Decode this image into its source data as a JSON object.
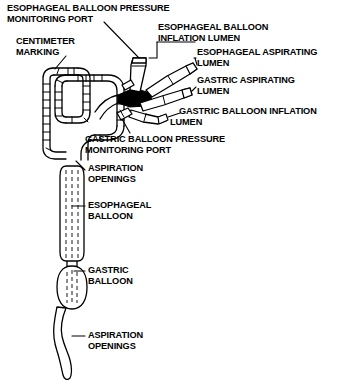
{
  "diagram": {
    "type": "medical-device-line-drawing",
    "colors": {
      "background": "#ffffff",
      "stroke": "#000000",
      "text": "#000000"
    },
    "labels": [
      {
        "id": "esophageal-balloon-pressure-monitoring-port",
        "text": "ESOPHAGEAL BALLOON PRESSURE\nMONITORING PORT",
        "x": 7,
        "y": 3
      },
      {
        "id": "centimeter-marking",
        "text": "CENTIMETER\nMARKING",
        "x": 16,
        "y": 36
      },
      {
        "id": "esophageal-balloon-inflation-lumen",
        "text": "ESOPHAGEAL BALLOON\nINFLATION LUMEN",
        "x": 158,
        "y": 22
      },
      {
        "id": "esophageal-aspirating-lumen",
        "text": "ESOPHAGEAL ASPIRATING\nLUMEN",
        "x": 197,
        "y": 47
      },
      {
        "id": "gastric-aspirating-lumen",
        "text": "GASTRIC ASPIRATING\nLUMEN",
        "x": 197,
        "y": 75
      },
      {
        "id": "gastric-balloon-inflation-lumen",
        "text": "GASTRIC BALLOON INFLATION\nLUMEN",
        "x": 170,
        "y": 106,
        "indent_second_line": true
      },
      {
        "id": "gastric-balloon-pressure-monitoring-port",
        "text": "GASTRIC BALLOON PRESSURE\nMONITORING PORT",
        "x": 85,
        "y": 134
      },
      {
        "id": "aspiration-openings-upper",
        "text": "ASPIRATION\nOPENINGS",
        "x": 88,
        "y": 163
      },
      {
        "id": "esophageal-balloon",
        "text": "ESOPHAGEAL\nBALLOON",
        "x": 88,
        "y": 200
      },
      {
        "id": "gastric-balloon",
        "text": "GASTRIC\nBALLOON",
        "x": 88,
        "y": 265
      },
      {
        "id": "aspiration-openings-lower",
        "text": "ASPIRATION\nOPENINGS",
        "x": 88,
        "y": 330
      }
    ],
    "parts": [
      {
        "id": "coiled-shaft",
        "name": "serpentine coiled tube with centimeter graduation marks"
      },
      {
        "id": "esophageal-balloon-pressure-port-connector",
        "name": "vertical stub connector at top of manifold"
      },
      {
        "id": "esophageal-aspirating-lumen-connector",
        "name": "upper angled tapered connector"
      },
      {
        "id": "gastric-aspirating-lumen-connector",
        "name": "middle angled tapered connector"
      },
      {
        "id": "gastric-balloon-inflation-lumen-connector",
        "name": "lower angled tapered connector"
      },
      {
        "id": "gastric-balloon-pressure-port-connector",
        "name": "small stub connector below manifold"
      },
      {
        "id": "esophageal-balloon-body",
        "name": "elongated cylindrical balloon with internal dashed lumens"
      },
      {
        "id": "gastric-balloon-body",
        "name": "oval balloon with internal dashed lumens"
      },
      {
        "id": "distal-tip",
        "name": "wavy tapered distal tip with aspiration openings"
      }
    ]
  }
}
